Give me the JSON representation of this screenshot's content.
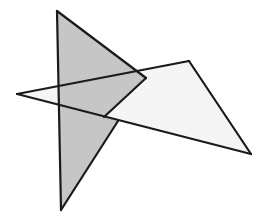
{
  "diagram": {
    "colors": {
      "background": "#ffffff",
      "shaded_fill": "#c6c6c6",
      "light_fill": "#f5f5f5",
      "stroke": "#1a1a1a"
    },
    "stroke_width": 2.2,
    "shaded_triangle": {
      "vertices": [
        [
          57,
          11
        ],
        [
          146,
          78
        ],
        [
          61,
          210
        ]
      ]
    },
    "light_triangle": {
      "vertices": [
        [
          17,
          94
        ],
        [
          189,
          61
        ],
        [
          251,
          154
        ]
      ]
    },
    "shaded_visible_polygon": [
      [
        57,
        11
      ],
      [
        146,
        78
      ],
      [
        104,
        117
      ],
      [
        118,
        121
      ],
      [
        61,
        210
      ]
    ],
    "visible_edges": [
      [
        [
          57,
          11
        ],
        [
          61,
          210
        ]
      ],
      [
        [
          57,
          11
        ],
        [
          146,
          78
        ]
      ],
      [
        [
          146,
          78
        ],
        [
          104,
          117
        ]
      ],
      [
        [
          118,
          121
        ],
        [
          61,
          210
        ]
      ],
      [
        [
          17,
          94
        ],
        [
          189,
          61
        ]
      ],
      [
        [
          189,
          61
        ],
        [
          251,
          154
        ]
      ],
      [
        [
          251,
          154
        ],
        [
          17,
          94
        ]
      ]
    ]
  }
}
